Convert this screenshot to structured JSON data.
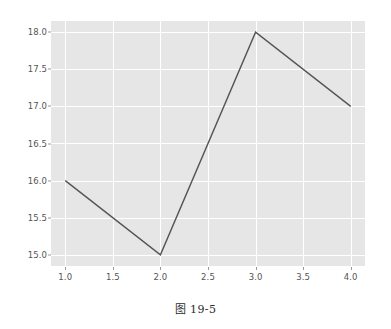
{
  "caption": "图 19-5",
  "chart_data": {
    "type": "line",
    "title": "",
    "xlabel": "",
    "ylabel": "",
    "x": [
      1,
      2,
      3,
      4
    ],
    "values": [
      16,
      15,
      18,
      17
    ],
    "series": [
      {
        "name": "series-1",
        "x": [
          1,
          2,
          3,
          4
        ],
        "values": [
          16,
          15,
          18,
          17
        ]
      }
    ],
    "xlim": [
      0.85,
      4.15
    ],
    "ylim": [
      14.85,
      18.15
    ],
    "xticks": [
      1.0,
      1.5,
      2.0,
      2.5,
      3.0,
      3.5,
      4.0
    ],
    "yticks": [
      15.0,
      15.5,
      16.0,
      16.5,
      17.0,
      17.5,
      18.0
    ],
    "xticklabels": [
      "1.0",
      "1.5",
      "2.0",
      "2.5",
      "3.0",
      "3.5",
      "4.0"
    ],
    "yticklabels": [
      "15.0",
      "15.5",
      "16.0",
      "16.5",
      "17.0",
      "17.5",
      "18.0"
    ],
    "grid": true,
    "grid_color": "#ffffff",
    "legend": false,
    "legend_position": "none",
    "line_color": "#555555",
    "line_width": 1.4,
    "marker": "none",
    "axes_facecolor": "#e6e6e6",
    "figure_facecolor": "#ffffff",
    "tick_label_color": "#555555",
    "style": "ggplot"
  }
}
